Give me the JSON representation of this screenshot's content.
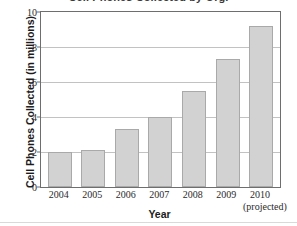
{
  "chart_data": {
    "type": "bar",
    "title": "",
    "xlabel": "Year",
    "ylabel": "Cell Phones Collected (in millions)",
    "categories": [
      "2004",
      "2005",
      "2006",
      "2007",
      "2008",
      "2009",
      "2010"
    ],
    "category_sublabels": [
      "",
      "",
      "",
      "",
      "",
      "",
      "(projected)"
    ],
    "values": [
      2.0,
      2.1,
      3.3,
      4.0,
      5.5,
      7.3,
      9.2
    ],
    "ylim": [
      0,
      10
    ],
    "yticks": [
      0,
      2,
      4,
      6,
      8,
      10
    ],
    "ytick_labels": [
      "0",
      "2",
      "4",
      "6",
      "8",
      "10"
    ],
    "grid": "horizontal",
    "legend": "none",
    "bar_color": "#d2d2d2",
    "bar_border_color": "#a9a9a9",
    "gridline_color": "#c2c2c2",
    "axis_color": "#6e6e6e"
  },
  "axes": {
    "y_title": "Cell Phones Collected (in millions)",
    "x_title": "Year"
  },
  "title_remnant": "Cell Phones Collected by Org."
}
